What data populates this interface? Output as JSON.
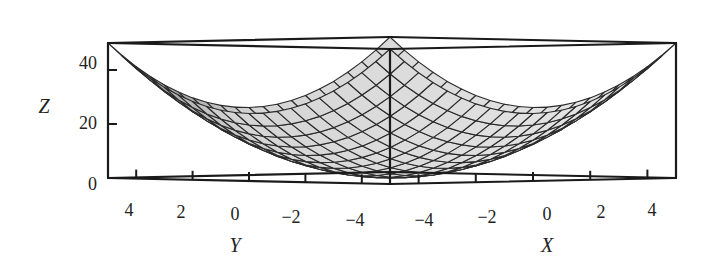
{
  "chart_data": {
    "type": "surface3d",
    "function": "Z = X^2 + Y^2",
    "title": "",
    "x": {
      "label": "X",
      "range": [
        -5,
        5
      ],
      "ticks": [
        -4,
        -2,
        0,
        2,
        4
      ],
      "tick_labels": [
        "−4",
        "−2",
        "0",
        "2",
        "4"
      ]
    },
    "y": {
      "label": "Y",
      "range": [
        -5,
        5
      ],
      "ticks": [
        4,
        2,
        0,
        -2,
        -4
      ],
      "tick_labels": [
        "4",
        "2",
        "0",
        "−2",
        "−4"
      ]
    },
    "z": {
      "label": "Z",
      "range": [
        0,
        50
      ],
      "ticks": [
        0,
        20,
        40
      ],
      "tick_labels": [
        "0",
        "20",
        "40"
      ]
    },
    "grid_lines_per_axis": 21,
    "colors": {
      "surface_light": "#e6e6e6",
      "surface_dark": "#4a4a4a",
      "mesh": "#2a2a2a",
      "box": "#1a1a1a"
    },
    "view": "box corner facing viewer; Y axis at left front edge, X axis at right front edge"
  },
  "labels": {
    "z_axis": "Z",
    "y_axis": "Y",
    "x_axis": "X",
    "z_ticks": [
      "0",
      "20",
      "40"
    ],
    "y_ticks": [
      "4",
      "2",
      "0",
      "−2",
      "−4"
    ],
    "x_ticks": [
      "−4",
      "−2",
      "0",
      "2",
      "4"
    ]
  }
}
